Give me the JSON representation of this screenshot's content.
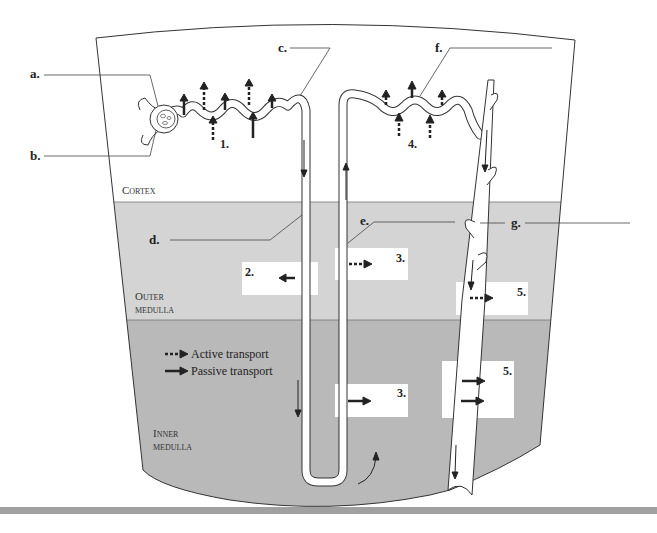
{
  "diagram": {
    "regions": {
      "cortex": "Cortex",
      "outer_medulla_1": "Outer",
      "outer_medulla_2": "medulla",
      "inner_medulla_1": "Inner",
      "inner_medulla_2": "medulla"
    },
    "colors": {
      "cortex": "#ffffff",
      "outer_medulla": "#d4d4d4",
      "inner_medulla": "#b9b9b9",
      "tubule": "#ffffff",
      "outline": "#333333",
      "bottom_bar": "#a0a0a0"
    },
    "labels": {
      "a": "a.",
      "b": "b.",
      "c": "c.",
      "d": "d.",
      "e": "e.",
      "f": "f.",
      "g": "g."
    },
    "transport_sites": {
      "s1": "1.",
      "s2": "2.",
      "s3_outer": "3.",
      "s3_inner": "3.",
      "s4": "4.",
      "s5_outer": "5.",
      "s5_inner": "5."
    },
    "legend": {
      "active": "Active transport",
      "passive": "Passive transport"
    }
  }
}
